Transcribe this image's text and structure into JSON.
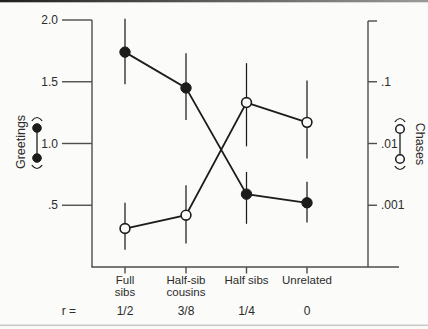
{
  "figure": {
    "background": "#fbfbf9",
    "ink": "#1c1c1c",
    "axis_color": "#4d4d4d",
    "top_border_dark": "#1f1f1f",
    "top_border_light": "#9a9a9a",
    "bottom_border_color": "#c9c9c6"
  },
  "chart_data": {
    "type": "line",
    "title": "",
    "categories": [
      "Full sibs",
      "Half-sib cousins",
      "Half sibs",
      "Unrelated"
    ],
    "category_label_lines": [
      [
        "Full",
        "sibs"
      ],
      [
        "Half-sib",
        "cousins"
      ],
      [
        "Half sibs"
      ],
      [
        "Unrelated"
      ]
    ],
    "relatedness": {
      "prefix": "r =",
      "values": [
        "1/2",
        "3/8",
        "1/4",
        "0"
      ]
    },
    "axes": {
      "left": {
        "label": "Greetings",
        "marker_legend": "filled-circle-pair",
        "scale": "linear",
        "range": [
          0,
          2.0
        ],
        "ticks": [
          {
            "label": "2.0",
            "value": 2.0
          },
          {
            "label": "1.5",
            "value": 1.5
          },
          {
            "label": "1.0",
            "value": 1.0
          },
          {
            "label": ".5",
            "value": 0.5
          }
        ]
      },
      "right": {
        "label": "Chases",
        "marker_legend": "open-circle-pair",
        "scale": "log",
        "range": [
          0.0001,
          1.0
        ],
        "ticks": [
          {
            "label": "",
            "value": 1.0
          },
          {
            "label": ".1",
            "value": 0.1
          },
          {
            "label": ".01",
            "value": 0.01
          },
          {
            "label": ".001",
            "value": 0.001
          }
        ]
      }
    },
    "series": [
      {
        "name": "Greetings",
        "axis": "left",
        "marker": "filled-circle",
        "values": [
          1.74,
          1.45,
          0.59,
          0.52
        ],
        "error_low": [
          1.48,
          1.19,
          0.35,
          0.36
        ],
        "error_high": [
          2.01,
          1.73,
          0.77,
          0.69
        ]
      },
      {
        "name": "Chases",
        "axis": "right",
        "marker": "open-circle",
        "values": [
          0.00042,
          0.00069,
          0.046,
          0.022
        ],
        "error_low": [
          0.00019,
          0.00024,
          0.009,
          0.0057
        ],
        "error_high": [
          0.0011,
          0.0021,
          0.2,
          0.105
        ]
      }
    ],
    "legend_position": "axis-titles",
    "grid": false
  }
}
